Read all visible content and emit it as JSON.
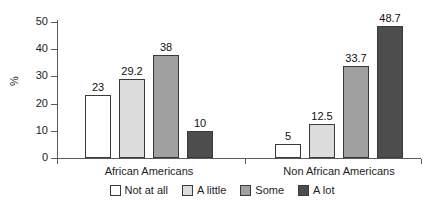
{
  "chart_data": {
    "type": "bar",
    "title": "",
    "subtitle": "",
    "xlabel": "",
    "ylabel": "%",
    "ylim": [
      0,
      50
    ],
    "yticks": [
      0,
      10,
      20,
      30,
      40,
      50
    ],
    "ytick_labels": [
      "0",
      "10",
      "20",
      "30",
      "40",
      "50"
    ],
    "grid": false,
    "legend_position": "bottom-center",
    "categories": [
      "African Americans",
      "Non African Americans"
    ],
    "series": [
      {
        "name": "Not at all",
        "color": "#ffffff",
        "values": [
          23,
          5
        ],
        "value_labels": [
          "23",
          "5"
        ]
      },
      {
        "name": "A little",
        "color": "#dcdcdc",
        "values": [
          29.2,
          12.5
        ],
        "value_labels": [
          "29.2",
          "12.5"
        ]
      },
      {
        "name": "Some",
        "color": "#a0a0a0",
        "values": [
          38,
          33.7
        ],
        "value_labels": [
          "38",
          "33.7"
        ]
      },
      {
        "name": "A lot",
        "color": "#4d4d4d",
        "values": [
          10,
          48.7
        ],
        "value_labels": [
          "10",
          "48.7"
        ]
      }
    ]
  },
  "colors": {
    "axis": "#5b5b5b",
    "bar_outline": "#3a3a3a",
    "text": "#1d1d1d",
    "background": "#ffffff"
  }
}
